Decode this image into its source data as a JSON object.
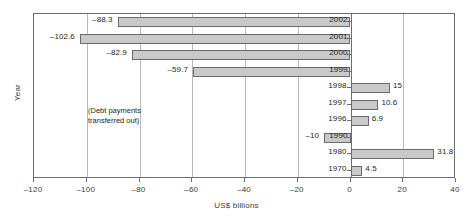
{
  "chart_data": {
    "type": "bar",
    "orientation": "horizontal",
    "title": "",
    "xlabel": "US$ billions",
    "ylabel": "Year",
    "xlim": [
      -120,
      40
    ],
    "xticks": [
      -120,
      -100,
      -80,
      -60,
      -40,
      -20,
      0,
      20,
      40
    ],
    "xtick_labels": [
      "-120",
      "-100",
      "-80",
      "-60",
      "-40",
      "-20",
      "0",
      "20",
      "40"
    ],
    "grid": true,
    "grid_axis": "x",
    "legend": "none",
    "categories": [
      "2002",
      "2001",
      "2000",
      "1999",
      "1998",
      "1997",
      "1996",
      "1990",
      "1980",
      "1970"
    ],
    "values": [
      -88.3,
      -102.6,
      -82.9,
      -59.7,
      15,
      10.6,
      6.9,
      -10,
      31.8,
      4.5
    ],
    "value_labels": [
      "-88.3",
      "-102.6",
      "-82.9",
      "-59.7",
      "15",
      "10.6",
      "6.9",
      "-10",
      "31.8",
      "4.5"
    ],
    "annotations": [
      {
        "line1": "(Debt payments",
        "line2": "transferred out)"
      }
    ],
    "bar_fill": "#c9c9c9",
    "bar_edge": "#6b6b6b",
    "axis_color": "#6e6e6e",
    "grid_color": "#b9b9b9"
  }
}
